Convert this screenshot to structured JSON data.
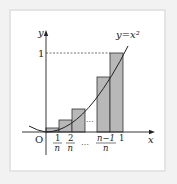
{
  "diagram": {
    "curve_label": "y=x²",
    "axis_x_label": "x",
    "axis_y_label": "y",
    "origin_label": "O",
    "y_tick_label": "1",
    "x_tick_labels": {
      "t1_num": "1",
      "t1_den": "n",
      "t2_num": "2",
      "t2_den": "n",
      "ellipsis": "…",
      "tn1_num": "n−1",
      "tn1_den": "n",
      "one": "1"
    },
    "middle_ellipsis": "···",
    "colors": {
      "bar_fill": "#b8b8b8",
      "bar_stroke": "#333333",
      "curve": "#222222",
      "frame_border": "#e4e4e4"
    }
  }
}
